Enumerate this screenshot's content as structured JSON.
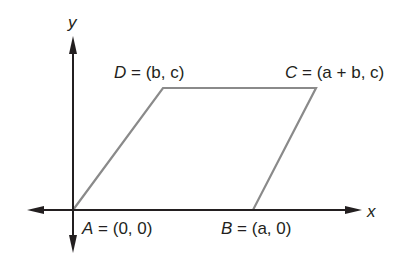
{
  "diagram": {
    "type": "parallelogram-on-coordinate-plane",
    "axes": {
      "x_label": "x",
      "y_label": "y",
      "color": "#231f20"
    },
    "shape": {
      "stroke_color": "#8a8a8a"
    },
    "vertices": [
      {
        "name": "A",
        "equals": "=",
        "coords": "(0, 0)"
      },
      {
        "name": "B",
        "equals": "=",
        "coords": "(a, 0)"
      },
      {
        "name": "C",
        "equals": "=",
        "coords": "(a + b, c)"
      },
      {
        "name": "D",
        "equals": "=",
        "coords": "(b, c)"
      }
    ]
  }
}
